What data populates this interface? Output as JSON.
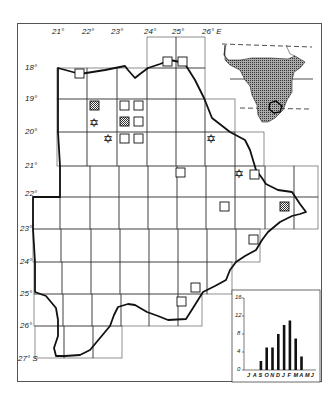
{
  "map": {
    "longitude_labels": [
      "21°",
      "22°",
      "23°",
      "24°",
      "25°",
      "26° E"
    ],
    "latitude_labels": [
      "18°",
      "19°",
      "20°",
      "21°",
      "22°",
      "23°",
      "24°",
      "25°",
      "26°",
      "27° S"
    ],
    "legend_markers": {
      "open_square": "record",
      "hatched_square": "record (stippled)",
      "star": "six-pointed star record"
    },
    "inset_locator": "Africa outline with stippled distribution and study area outlined"
  },
  "chart_data": {
    "type": "bar",
    "title": "",
    "xlabel": "",
    "ylabel": "",
    "categories": [
      "J",
      "A",
      "S",
      "O",
      "N",
      "D",
      "J",
      "F",
      "M",
      "A",
      "M",
      "J"
    ],
    "values": [
      0,
      0,
      2,
      5,
      5,
      8,
      10,
      11,
      7,
      3,
      0,
      0
    ],
    "yticks": [
      "0",
      "4",
      "8",
      "12",
      "16"
    ],
    "ylim": [
      0,
      16
    ],
    "grid": false,
    "legend": null
  }
}
